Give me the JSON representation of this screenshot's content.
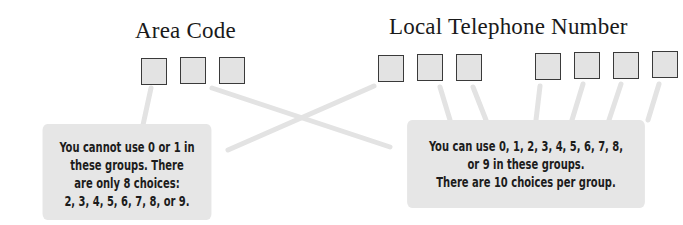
{
  "labels": {
    "area_code": "Area Code",
    "local_number": "Local Telephone Number"
  },
  "groups": {
    "area_code_boxes": 3,
    "local_prefix_boxes": 3,
    "local_line_boxes": 4
  },
  "callouts": {
    "left": {
      "lines": [
        "You cannot use 0 or 1 in",
        "these groups. There",
        "are only 8 choices:",
        "2, 3, 4, 5, 6, 7, 8, or 9."
      ]
    },
    "right": {
      "lines": [
        "You can use 0, 1, 2, 3, 4, 5, 6, 7, 8,",
        "or 9 in these groups.",
        "There are 10 choices per group."
      ]
    }
  },
  "colors": {
    "box_fill": "#e3e3e3",
    "box_border": "#3a3a3a",
    "callout_fill": "#e6e6e6",
    "connector": "#e2e2e2"
  }
}
